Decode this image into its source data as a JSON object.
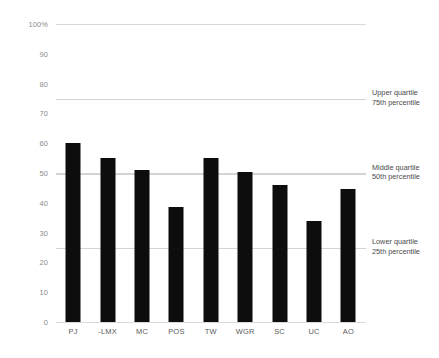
{
  "chart_data": {
    "type": "bar",
    "title": "",
    "subtitle": "",
    "xlabel": "",
    "ylabel": "",
    "categories": [
      "PJ",
      "-LMX",
      "MC",
      "POS",
      "TW",
      "WGR",
      "SC",
      "UC",
      "AO"
    ],
    "values": [
      60,
      55,
      51,
      38.5,
      55,
      50.5,
      46,
      34,
      44.5
    ],
    "ylim": [
      0,
      100
    ],
    "y_ticks": [
      0,
      10,
      20,
      30,
      40,
      50,
      60,
      70,
      80,
      90,
      100
    ],
    "y_tick_labels": [
      "0",
      "10",
      "20",
      "30",
      "40",
      "50",
      "60",
      "70",
      "80",
      "90",
      "100%"
    ],
    "grid": true,
    "legend": "none",
    "bar_color": "#0d0d0d",
    "gridline_color": "#d9d9d9",
    "reference_line_color": "#d4d4d4",
    "reference_lines": [
      {
        "value": 75,
        "label_line1": "Upper quartile",
        "label_line2": "75th percentile"
      },
      {
        "value": 50,
        "label_line1": "Middle quartile",
        "label_line2": "50th percentile"
      },
      {
        "value": 25,
        "label_line1": "Lower quartile",
        "label_line2": "25th percentile"
      }
    ],
    "annotations": [
      "Upper quartile 75th percentile",
      "Middle quartile 50th percentile",
      "Lower quartile 25th percentile"
    ]
  }
}
